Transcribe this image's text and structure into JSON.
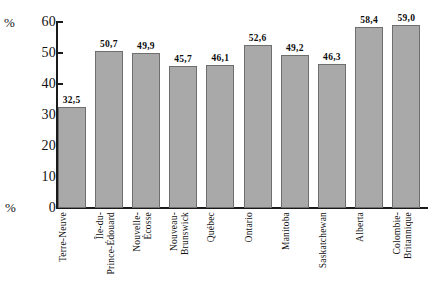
{
  "chart_data": {
    "type": "bar",
    "title": "",
    "xlabel": "",
    "ylabel": "%",
    "ylim": [
      0,
      60
    ],
    "ytick_step": 10,
    "grid": false,
    "legend": null,
    "axis_unit_top": "%",
    "axis_unit_bottom": "%",
    "value_label_format": "comma-decimal",
    "bar_color": "#a9a9a9",
    "bar_border_color": "#6e6e6e",
    "axis_color": "#1a1a1a",
    "ytick_labels": [
      "60",
      "50",
      "40",
      "30",
      "20",
      "10",
      "0"
    ],
    "categories": [
      "Terre-Neuve",
      "Île-du-Prince-Édouard",
      "Nouvelle-Écosse",
      "Nouveau-Brunswick",
      "Québec",
      "Ontario",
      "Manitoba",
      "Saskatchewan",
      "Alberta",
      "Colombie-Britannique"
    ],
    "category_lines": [
      [
        "Terre-Neuve"
      ],
      [
        "Île-du-",
        "Prince-Édouard"
      ],
      [
        "Nouvelle-",
        "Écosse"
      ],
      [
        "Nouveau-",
        "Brunswick"
      ],
      [
        "Québec"
      ],
      [
        "Ontario"
      ],
      [
        "Manitoba"
      ],
      [
        "Saskatchewan"
      ],
      [
        "Alberta"
      ],
      [
        "Colombie-",
        "Britannique"
      ]
    ],
    "values": [
      32.5,
      50.7,
      49.9,
      45.7,
      46.1,
      52.6,
      49.2,
      46.3,
      58.4,
      59.0
    ],
    "value_labels": [
      "32,5",
      "50,7",
      "49,9",
      "45,7",
      "46,1",
      "52,6",
      "49,2",
      "46,3",
      "58,4",
      "59,0"
    ]
  }
}
